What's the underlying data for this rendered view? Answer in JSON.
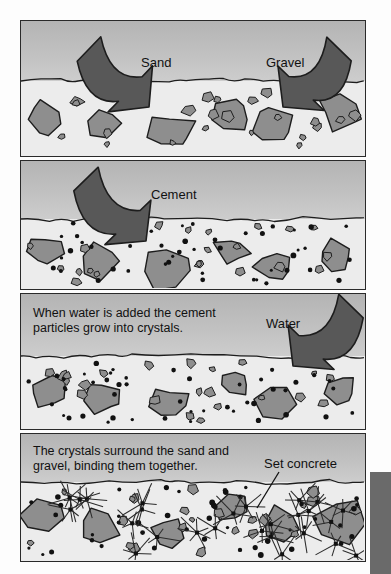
{
  "figure": {
    "background_color": "#fdfdfd",
    "panel_border_color": "#2a2a2a",
    "sky_color": "#c2c2c2",
    "ground_color": "#ececec",
    "aggregate_color": "#8e8e8e",
    "arrow_color": "#585858",
    "side_block_color": "#6a6a6a"
  },
  "panels": [
    {
      "id": "panel-1",
      "x": 20,
      "y": 20,
      "w": 346,
      "h": 137,
      "horizon": 60,
      "caption": "",
      "labels": [
        {
          "name": "sand-label",
          "text": "Sand",
          "x": 120,
          "y": 34
        },
        {
          "name": "gravel-label",
          "text": "Gravel",
          "x": 245,
          "y": 34
        }
      ],
      "arrows": [
        {
          "name": "sand-arrow",
          "from_x": 68,
          "from_y": 28,
          "to_x": 128,
          "to_y": 86
        },
        {
          "name": "gravel-arrow",
          "from_x": 318,
          "from_y": 28,
          "to_x": 262,
          "to_y": 86
        }
      ],
      "has_cement_dots": false,
      "has_crystals": false
    },
    {
      "id": "panel-2",
      "x": 20,
      "y": 160,
      "w": 346,
      "h": 130,
      "horizon": 58,
      "caption": "",
      "labels": [
        {
          "name": "cement-label",
          "text": "Cement",
          "x": 130,
          "y": 26
        }
      ],
      "arrows": [
        {
          "name": "cement-arrow",
          "from_x": 65,
          "from_y": 18,
          "to_x": 125,
          "to_y": 80
        }
      ],
      "has_cement_dots": true,
      "has_crystals": false
    },
    {
      "id": "panel-3",
      "x": 20,
      "y": 293,
      "w": 346,
      "h": 137,
      "horizon": 62,
      "caption": "When water is added the cement\nparticles grow into crystals.",
      "caption_x": 12,
      "caption_y": 12,
      "labels": [
        {
          "name": "water-label",
          "text": "Water",
          "x": 245,
          "y": 22
        }
      ],
      "arrows": [
        {
          "name": "water-arrow",
          "from_x": 330,
          "from_y": 12,
          "to_x": 272,
          "to_y": 72
        }
      ],
      "has_cement_dots": true,
      "has_crystals": false
    },
    {
      "id": "panel-4",
      "x": 20,
      "y": 433,
      "w": 346,
      "h": 129,
      "horizon": 48,
      "caption": "The crystals surround the sand and\ngravel, binding them together.",
      "caption_x": 12,
      "caption_y": 10,
      "labels": [
        {
          "name": "set-concrete-label",
          "text": "Set concrete",
          "x": 243,
          "y": 22
        }
      ],
      "arrows": [],
      "leader": {
        "name": "set-concrete-leader",
        "x1": 258,
        "y1": 38,
        "x2": 236,
        "y2": 74
      },
      "has_cement_dots": true,
      "has_crystals": true
    }
  ],
  "side_block": {
    "name": "side-block",
    "x": 370,
    "y": 472,
    "w": 21,
    "h": 102,
    "color": "#6a6a6a"
  }
}
